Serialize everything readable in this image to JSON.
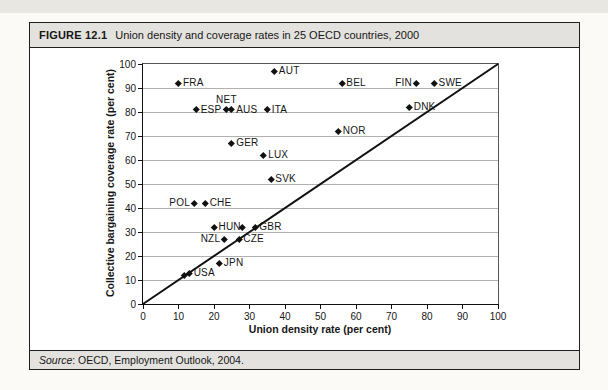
{
  "figure": {
    "label": "FIGURE 12.1",
    "title": "Union density and coverage rates in 25 OECD countries, 2000"
  },
  "source": {
    "prefix": "Source",
    "text": ": OECD, Employment Outlook, 2004."
  },
  "colors": {
    "bar_background": "#e3e2de",
    "border": "#1f1f1f",
    "gridline": "#b3b1ae",
    "marker": "#111111",
    "text": "#171717"
  },
  "chart_data": {
    "type": "scatter",
    "title": "Union density and coverage rates in 25 OECD countries, 2000",
    "xlabel": "Union density rate (per cent)",
    "ylabel": "Collective bargaining coverage rate (per cent)",
    "xlim": [
      0,
      100
    ],
    "ylim": [
      0,
      100
    ],
    "xticks": [
      0,
      10,
      20,
      30,
      40,
      50,
      60,
      70,
      80,
      90,
      100
    ],
    "yticks": [
      0,
      10,
      20,
      30,
      40,
      50,
      60,
      70,
      80,
      90,
      100
    ],
    "grid": "horizontal",
    "legend": "none",
    "marker": {
      "shape": "diamond",
      "color": "#111111"
    },
    "reference_line": {
      "type": "diagonal",
      "from": [
        0,
        0
      ],
      "to": [
        100,
        100
      ]
    },
    "points": [
      {
        "label": "AUT",
        "x": 37,
        "y": 97,
        "label_side": "right"
      },
      {
        "label": "FRA",
        "x": 10,
        "y": 92,
        "label_side": "right"
      },
      {
        "label": "BEL",
        "x": 56,
        "y": 92,
        "label_side": "right"
      },
      {
        "label": "FIN",
        "x": 77,
        "y": 92,
        "label_side": "left"
      },
      {
        "label": "SWE",
        "x": 82,
        "y": 92,
        "label_side": "right"
      },
      {
        "label": "ESP",
        "x": 15,
        "y": 81,
        "label_side": "right"
      },
      {
        "label": "NET",
        "x": 23.5,
        "y": 81,
        "label_side": "above"
      },
      {
        "label": "AUS",
        "x": 25,
        "y": 81,
        "label_side": "right"
      },
      {
        "label": "ITA",
        "x": 35,
        "y": 81,
        "label_side": "right"
      },
      {
        "label": "DNK",
        "x": 75,
        "y": 82,
        "label_side": "right"
      },
      {
        "label": "NOR",
        "x": 55,
        "y": 72,
        "label_side": "right"
      },
      {
        "label": "GER",
        "x": 25,
        "y": 67,
        "label_side": "right"
      },
      {
        "label": "LUX",
        "x": 34,
        "y": 62,
        "label_side": "right"
      },
      {
        "label": "SVK",
        "x": 36,
        "y": 52,
        "label_side": "right"
      },
      {
        "label": "POL",
        "x": 14.5,
        "y": 42,
        "label_side": "left"
      },
      {
        "label": "CHE",
        "x": 17.5,
        "y": 42,
        "label_side": "right"
      },
      {
        "label": "HUN",
        "x": 20,
        "y": 32,
        "label_side": "right"
      },
      {
        "label": "",
        "x": 28,
        "y": 32,
        "label_side": "none"
      },
      {
        "label": "GBR",
        "x": 31.5,
        "y": 32,
        "label_side": "right"
      },
      {
        "label": "NZL",
        "x": 23,
        "y": 27,
        "label_side": "left"
      },
      {
        "label": "CZE",
        "x": 27,
        "y": 27,
        "label_side": "right"
      },
      {
        "label": "JPN",
        "x": 21.5,
        "y": 17,
        "label_side": "right"
      },
      {
        "label": "",
        "x": 11.5,
        "y": 12,
        "label_side": "none"
      },
      {
        "label": "USA",
        "x": 13,
        "y": 13,
        "label_side": "right"
      }
    ]
  }
}
